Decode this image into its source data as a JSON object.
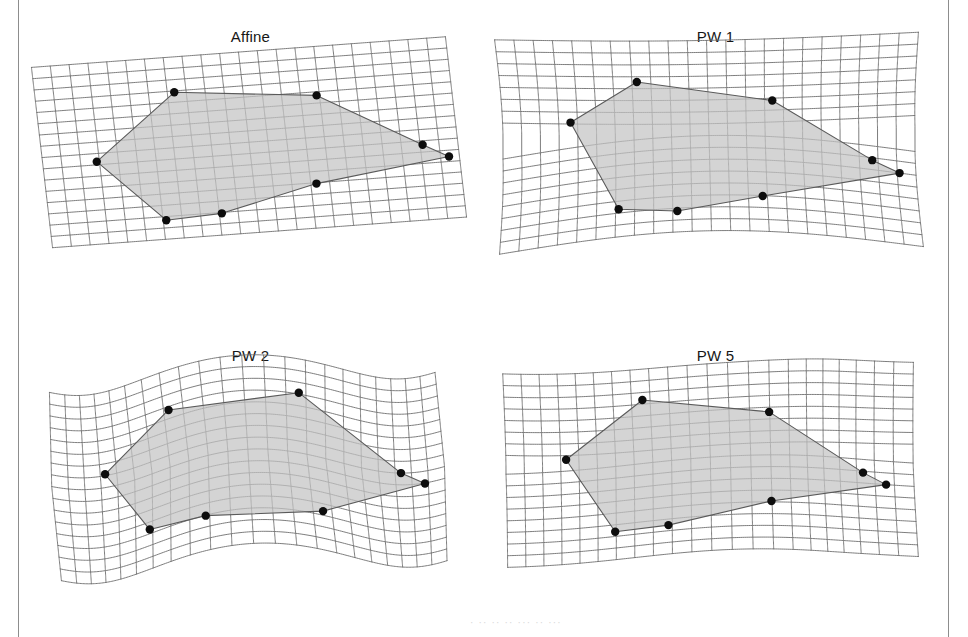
{
  "figure": {
    "type": "deformation-grid-panels",
    "background_color": "#ffffff",
    "rows": 2,
    "columns": 2,
    "scan_rule_color": "#8d8d8d",
    "caption_fragment": "· ·· ·· ·· ··· ·· ···"
  },
  "style": {
    "grid_line_color": "#6e6e6e",
    "grid_line_width": 0.9,
    "polygon_fill": "#c4c4c4",
    "polygon_fill_opacity": 0.72,
    "polygon_stroke": "#5a5a5a",
    "polygon_stroke_width": 1.1,
    "landmark_color": "#0d0d0d",
    "landmark_radius": 4.2,
    "title_color": "#161616"
  },
  "chart_data": {
    "type": "line",
    "xlabel": "",
    "ylabel": "",
    "grid": true,
    "legend": "none",
    "panels": [
      {
        "id": "affine",
        "label": "Affine",
        "position": "top-left",
        "warp": {
          "kind": "affine-shear",
          "description": "Uniform linear shear: straight grid lines, rotated parallelogram.",
          "shear_x": 0.085,
          "shear_y": -0.085,
          "bend": 0.0,
          "wave_amplitude": 0.0,
          "pinch": 0.0
        },
        "grid": {
          "columns": 22,
          "rows": 16,
          "x0": 24,
          "y0": 52,
          "x1": 438,
          "y1": 232
        },
        "polygon_uv": [
          [
            0.335,
            0.195
          ],
          [
            0.675,
            0.27
          ],
          [
            0.915,
            0.585
          ],
          [
            0.975,
            0.66
          ],
          [
            0.65,
            0.755
          ],
          [
            0.415,
            0.88
          ],
          [
            0.28,
            0.895
          ],
          [
            0.13,
            0.545
          ]
        ],
        "landmark_count": 8
      },
      {
        "id": "pw1",
        "label": "PW 1",
        "position": "top-right",
        "warp": {
          "kind": "piecewise-bend-1",
          "description": "Single smooth bow: horizontal lines sag toward the centre, vertical lines fan out.",
          "shear_x": 0.02,
          "shear_y": -0.02,
          "bend": 0.115,
          "wave_amplitude": 0.0,
          "pinch": 0.0
        },
        "grid": {
          "columns": 22,
          "rows": 16,
          "x0": 20,
          "y0": 48,
          "x1": 432,
          "y1": 238
        },
        "polygon_uv": [
          [
            0.33,
            0.215
          ],
          [
            0.655,
            0.325
          ],
          [
            0.895,
            0.575
          ],
          [
            0.96,
            0.625
          ],
          [
            0.625,
            0.815
          ],
          [
            0.42,
            0.89
          ],
          [
            0.28,
            0.855
          ],
          [
            0.165,
            0.43
          ]
        ],
        "landmark_count": 8
      },
      {
        "id": "pw2",
        "label": "PW 2",
        "position": "bottom-left",
        "warp": {
          "kind": "piecewise-wave-2",
          "description": "Two-lobe S-wave: grid undulates vertically across the width.",
          "shear_x": 0.05,
          "shear_y": -0.055,
          "bend": 0.0,
          "wave_amplitude": 0.085,
          "wave_cycles": 1.25,
          "pinch": 0.0
        },
        "grid": {
          "columns": 22,
          "rows": 16,
          "x0": 30,
          "y0": 52,
          "x1": 430,
          "y1": 240
        },
        "polygon_uv": [
          [
            0.33,
            0.205
          ],
          [
            0.62,
            0.18
          ],
          [
            0.88,
            0.5
          ],
          [
            0.945,
            0.565
          ],
          [
            0.66,
            0.79
          ],
          [
            0.4,
            0.815
          ],
          [
            0.265,
            0.79
          ],
          [
            0.15,
            0.43
          ]
        ],
        "landmark_count": 8
      },
      {
        "id": "pw5",
        "label": "PW 5",
        "position": "bottom-right",
        "warp": {
          "kind": "piecewise-local-5",
          "description": "Five-component warp: mild global bow plus local compression of vertical lines on the right.",
          "shear_x": 0.02,
          "shear_y": -0.03,
          "bend": 0.035,
          "wave_amplitude": 0.022,
          "wave_cycles": 1.0,
          "pinch": 0.16,
          "pinch_center": 0.78
        },
        "grid": {
          "columns": 22,
          "rows": 16,
          "x0": 22,
          "y0": 50,
          "x1": 432,
          "y1": 236
        },
        "polygon_uv": [
          [
            0.345,
            0.165
          ],
          [
            0.635,
            0.275
          ],
          [
            0.88,
            0.57
          ],
          [
            0.935,
            0.625
          ],
          [
            0.635,
            0.745
          ],
          [
            0.4,
            0.845
          ],
          [
            0.27,
            0.85
          ],
          [
            0.15,
            0.46
          ]
        ],
        "landmark_count": 8
      }
    ]
  }
}
